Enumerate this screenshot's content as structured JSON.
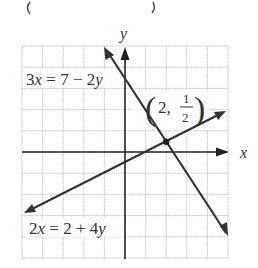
{
  "top_partial_text": "( — )",
  "axes": {
    "x_label": "x",
    "y_label": "y",
    "x_range": [
      -5,
      5
    ],
    "y_range": [
      -5,
      5
    ],
    "grid": true
  },
  "equations": [
    {
      "label_num": "3",
      "label_rest": " = 7 − 2",
      "label_var1": "x",
      "label_var2": "y",
      "text": "3x = 7 − 2y",
      "slope": -1.5,
      "intercept": 3.5
    },
    {
      "label_num": "2",
      "label_rest": " = 2 + 4",
      "label_var1": "x",
      "label_var2": "y",
      "text": "2x = 2 + 4y",
      "slope": 0.5,
      "intercept": -0.5
    }
  ],
  "intersection": {
    "x": 2,
    "y": 0.5,
    "open": "(",
    "x_text": "2,",
    "num": "1",
    "den": "2",
    "close": ")"
  },
  "colors": {
    "grid": "#b8b8b8",
    "axis": "#222222",
    "line": "#333333"
  }
}
